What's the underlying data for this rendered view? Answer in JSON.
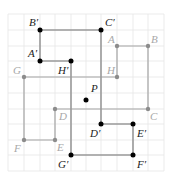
{
  "diagram": {
    "type": "rotation-on-grid",
    "grid": {
      "origin_px": [
        8,
        14
      ],
      "cell_px": 15.6,
      "cols": 10,
      "rows": 10,
      "color": "#e6e6e6"
    },
    "center": {
      "label": "P",
      "grid": [
        5,
        5
      ]
    },
    "original": {
      "color": "#a6a6a6",
      "points": [
        {
          "label": "A",
          "grid": [
            7,
            2
          ]
        },
        {
          "label": "B",
          "grid": [
            9,
            2
          ]
        },
        {
          "label": "C",
          "grid": [
            9,
            6
          ]
        },
        {
          "label": "D",
          "grid": [
            3,
            6
          ]
        },
        {
          "label": "E",
          "grid": [
            3,
            8
          ]
        },
        {
          "label": "F",
          "grid": [
            1,
            8
          ]
        },
        {
          "label": "G",
          "grid": [
            1,
            4
          ]
        },
        {
          "label": "H",
          "grid": [
            7,
            4
          ]
        }
      ]
    },
    "image": {
      "color": "#000000",
      "points": [
        {
          "label": "A′",
          "grid": [
            2,
            3
          ]
        },
        {
          "label": "B′",
          "grid": [
            2,
            1
          ]
        },
        {
          "label": "C′",
          "grid": [
            6,
            1
          ]
        },
        {
          "label": "D′",
          "grid": [
            6,
            7
          ]
        },
        {
          "label": "E′",
          "grid": [
            8,
            7
          ]
        },
        {
          "label": "F′",
          "grid": [
            8,
            9
          ]
        },
        {
          "label": "G′",
          "grid": [
            4,
            9
          ]
        },
        {
          "label": "H′",
          "grid": [
            4,
            3
          ]
        }
      ]
    }
  },
  "labels": {
    "A": "A",
    "B": "B",
    "C": "C",
    "D": "D",
    "E": "E",
    "F": "F",
    "G": "G",
    "H": "H",
    "A_prime": "A′",
    "B_prime": "B′",
    "C_prime": "C′",
    "D_prime": "D′",
    "E_prime": "E′",
    "F_prime": "F′",
    "G_prime": "G′",
    "H_prime": "H′",
    "P": "P"
  }
}
